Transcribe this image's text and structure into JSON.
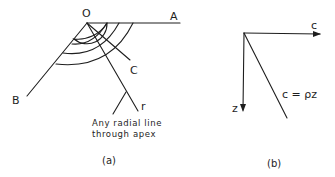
{
  "figure_a": {
    "labels": {
      "apex": "O",
      "point_a": "A",
      "point_b": "B",
      "point_c": "C",
      "radial": "r"
    },
    "annotation": {
      "line1": "Any radial line",
      "line2": "through apex"
    },
    "caption": "(a)"
  },
  "figure_b": {
    "labels": {
      "c_axis": "c",
      "z_axis": "z",
      "relation": "c = ρz"
    },
    "caption": "(b)"
  },
  "colors": {
    "ink": "#1e1e1e",
    "background": "#ffffff"
  }
}
